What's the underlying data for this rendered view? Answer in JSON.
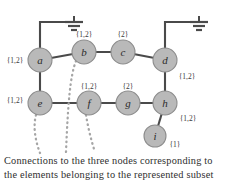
{
  "diagram": {
    "colors": {
      "node_fill": "#b9b9b9",
      "node_stroke": "#8d8d8d",
      "edge": "#4a4a4a",
      "dotted": "#a0a0a0",
      "text": "#2b2b2b",
      "background": "#ffffff"
    },
    "nodes": [
      {
        "id": "a",
        "label": "a",
        "cx": 40,
        "cy": 60,
        "r": 12,
        "tag": "{1,2}",
        "tag_x": 15,
        "tag_y": 60
      },
      {
        "id": "b",
        "label": "b",
        "cx": 84,
        "cy": 52,
        "r": 12,
        "tag": "{1,2}",
        "tag_x": 84,
        "tag_y": 34
      },
      {
        "id": "c",
        "label": "c",
        "cx": 123,
        "cy": 52,
        "r": 12,
        "tag": "{2}",
        "tag_x": 123,
        "tag_y": 34
      },
      {
        "id": "d",
        "label": "d",
        "cx": 165,
        "cy": 60,
        "r": 12,
        "tag": "{1,2}",
        "tag_x": 185,
        "tag_y": 76
      },
      {
        "id": "e",
        "label": "e",
        "cx": 40,
        "cy": 103,
        "r": 12,
        "tag": "{1,2}",
        "tag_x": 15,
        "tag_y": 100
      },
      {
        "id": "f",
        "label": "f",
        "cx": 89,
        "cy": 103,
        "r": 12,
        "tag": "{1,2}",
        "tag_x": 89,
        "tag_y": 86
      },
      {
        "id": "g",
        "label": "g",
        "cx": 128,
        "cy": 103,
        "r": 12,
        "tag": "{2}",
        "tag_x": 128,
        "tag_y": 86
      },
      {
        "id": "h",
        "label": "h",
        "cx": 165,
        "cy": 103,
        "r": 12,
        "tag": "{1,2}",
        "tag_x": 188,
        "tag_y": 118
      },
      {
        "id": "i",
        "label": "i",
        "cx": 155,
        "cy": 136,
        "r": 11,
        "tag": "{1}",
        "tag_x": 175,
        "tag_y": 144
      }
    ],
    "edges": [
      {
        "from": "a",
        "to": "b"
      },
      {
        "from": "b",
        "to": "c"
      },
      {
        "from": "c",
        "to": "d"
      },
      {
        "from": "a",
        "to": "e"
      },
      {
        "from": "d",
        "to": "h"
      },
      {
        "from": "e",
        "to": "f"
      },
      {
        "from": "f",
        "to": "g"
      },
      {
        "from": "g",
        "to": "h"
      },
      {
        "from": "h",
        "to": "i"
      }
    ],
    "grounds": [
      {
        "id": "ground-left",
        "node": "a",
        "x": 62,
        "y": 22
      },
      {
        "id": "ground-right",
        "node": "d",
        "x": 187,
        "y": 22
      }
    ],
    "dotted_connections": [
      {
        "id": "dotted-from-b",
        "from": "b"
      },
      {
        "id": "dotted-from-e",
        "from": "e"
      },
      {
        "id": "dotted-from-f",
        "from": "f"
      }
    ],
    "caption": {
      "line1": "Connections to the three nodes corresponding to",
      "line2": "the elements belonging to the represented subset"
    }
  }
}
